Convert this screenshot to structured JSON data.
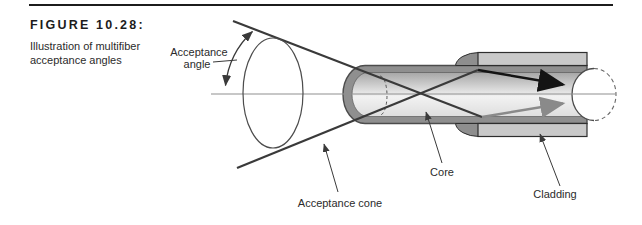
{
  "figure": {
    "label": "FIGURE 10.28:",
    "caption_lines": [
      "Illustration of multifiber",
      "acceptance angles"
    ]
  },
  "diagram": {
    "labels": {
      "acceptance_angle": [
        "Acceptance",
        "angle"
      ],
      "acceptance_cone": "Acceptance cone",
      "core": "Core",
      "cladding": "Cladding"
    },
    "colors": {
      "rule": "#1c1c1c",
      "line": "#3a3a3a",
      "axis": "#8f8f8f",
      "cladding_band": "#8f8f8f",
      "sleeve_fill": "#c9c9c9",
      "shoulder_fill": "#8e8e8e",
      "core_top": "#a6a6a6",
      "core_light": "#f2f2f2",
      "core_bottom": "#dedede",
      "ray_strong": "#141414",
      "ray_soft": "#8a8a8a"
    }
  }
}
